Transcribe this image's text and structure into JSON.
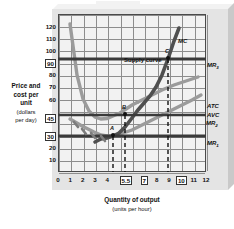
{
  "axes": {
    "y_title_line1": "Price and",
    "y_title_line2": "cost per",
    "y_title_line3": "unit",
    "y_title_sub1": "(dollars",
    "y_title_sub2": "per day)",
    "x_title": "Quantity of output",
    "x_title_sub": "(units per hour)",
    "y_ticks": [
      "10",
      "20",
      "30",
      "45",
      "60",
      "70",
      "80",
      "90",
      "100",
      "110",
      "120"
    ],
    "x_ticks": [
      "0",
      "1",
      "2",
      "3",
      "4",
      "5.5",
      "7",
      "8",
      "9",
      "10",
      "11",
      "12"
    ]
  },
  "annotations": {
    "mc": "MC",
    "supply_curve": "Supply curve",
    "atc": "ATC",
    "avc": "AVC",
    "mr1": "MR",
    "mr1_sub": "1",
    "mr2": "MR",
    "mr2_sub": "2",
    "mr3": "MR",
    "mr3_sub": "3",
    "point_a": "A",
    "point_b": "B",
    "point_c": "C"
  },
  "colors": {
    "plot_bg": "#f2f2f2",
    "grid": "#8d8d8d",
    "frame": "#4a4a4a",
    "curve_dark": "#4f4f4f",
    "curve_light": "#9b9b9b",
    "mr_line": "#3a3a3a",
    "plate": "#e4e4e4"
  },
  "chart_data": {
    "type": "line",
    "title": "",
    "xlabel": "Quantity of output (units per hour)",
    "ylabel": "Price and cost per unit (dollars per day)",
    "xlim": [
      0,
      12
    ],
    "ylim": [
      0,
      130
    ],
    "grid": true,
    "legend": "inline-right-labels",
    "x_tick_values": [
      0,
      1,
      2,
      3,
      4,
      5.5,
      7,
      8,
      9,
      10,
      11,
      12
    ],
    "y_tick_values": [
      10,
      20,
      30,
      45,
      60,
      70,
      80,
      90,
      100,
      110,
      120
    ],
    "highlighted_x_ticks": [
      5.5,
      7,
      10
    ],
    "highlighted_y_ticks": [
      30,
      45,
      90
    ],
    "series": [
      {
        "name": "MC",
        "label": "MC",
        "style": "solid-dark",
        "note": "marginal cost, U-shaped rising steeply; also labelled Supply curve above minimum AVC",
        "x": [
          3.0,
          4.0,
          4.5,
          5.0,
          5.5,
          6.0,
          6.5,
          7.0,
          7.5,
          8.0,
          8.5,
          9.0,
          9.5,
          10.0,
          10.5,
          11.0
        ],
        "y": [
          38,
          30,
          28.5,
          29,
          30,
          32,
          36,
          45,
          52,
          58,
          64,
          70,
          79,
          90,
          104,
          122
        ]
      },
      {
        "name": "ATC",
        "label": "ATC",
        "style": "solid-light",
        "note": "average total cost, U-shaped, minimum near q=7",
        "x": [
          1.0,
          2.0,
          3.0,
          4.0,
          5.0,
          6.0,
          7.0,
          8.0,
          9.0,
          10.0,
          11.0,
          12.0
        ],
        "y": [
          122,
          80,
          60,
          50,
          46,
          44.5,
          45,
          46.5,
          49,
          52,
          55,
          58
        ]
      },
      {
        "name": "AVC",
        "label": "AVC",
        "style": "solid-light",
        "note": "average variable cost, U-shaped, minimum near q=5.5 at 30",
        "x": [
          1.0,
          2.0,
          3.0,
          4.0,
          5.0,
          5.5,
          6.0,
          7.0,
          8.0,
          9.0,
          10.0,
          11.0,
          12.0
        ],
        "y": [
          44,
          38,
          33,
          30.5,
          30,
          30,
          30.5,
          33,
          37,
          41,
          45,
          50,
          55
        ]
      },
      {
        "name": "MR1",
        "label": "MR1",
        "style": "horizontal-dark",
        "note": "horizontal marginal revenue line at price 30 (shutdown point)",
        "x": [
          0,
          12
        ],
        "y": [
          30,
          30
        ]
      },
      {
        "name": "MR2",
        "label": "MR2",
        "style": "horizontal-dark",
        "note": "horizontal marginal revenue line at price 45 (break-even point)",
        "x": [
          0,
          12
        ],
        "y": [
          45,
          45
        ]
      },
      {
        "name": "MR3",
        "label": "MR3",
        "style": "horizontal-dark",
        "note": "horizontal marginal revenue line at price 90 (profit maximising)",
        "x": [
          0,
          12
        ],
        "y": [
          90,
          90
        ]
      }
    ],
    "points": [
      {
        "label": "A",
        "x": 5.5,
        "y": 30,
        "note": "shutdown point, MC = AVC minimum = MR1"
      },
      {
        "label": "B",
        "x": 7.0,
        "y": 45,
        "note": "break-even point, MC = ATC minimum = MR2"
      },
      {
        "label": "C",
        "x": 10.0,
        "y": 90,
        "note": "profit maximising output, MC = MR3"
      }
    ],
    "text_annotations": [
      {
        "text": "Supply curve",
        "x": 6.4,
        "y": 104,
        "note": "labels the MC curve above AVC minimum"
      }
    ]
  }
}
